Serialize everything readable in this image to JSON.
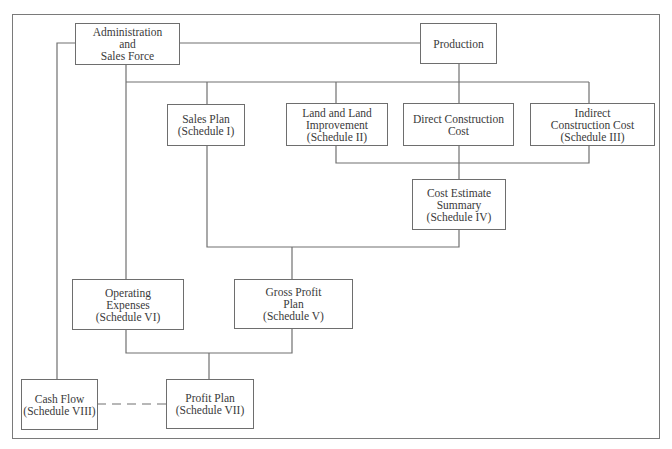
{
  "diagram": {
    "nodes": {
      "admin": {
        "lines": [
          "Administration",
          "and",
          "Sales Force"
        ]
      },
      "production": {
        "lines": [
          "Production"
        ]
      },
      "sales_plan": {
        "lines": [
          "Sales Plan",
          "(Schedule I)"
        ]
      },
      "land": {
        "lines": [
          "Land and Land",
          "Improvement",
          "(Schedule II)"
        ]
      },
      "direct": {
        "lines": [
          "Direct Construction",
          "Cost"
        ]
      },
      "indirect": {
        "lines": [
          "Indirect",
          "Construction Cost",
          "(Schedule III)"
        ]
      },
      "cost_estimate": {
        "lines": [
          "Cost Estimate",
          "Summary",
          "(Schedule IV)"
        ]
      },
      "operating": {
        "lines": [
          "Operating",
          "Expenses",
          "(Schedule VI)"
        ]
      },
      "gross_profit": {
        "lines": [
          "Gross Profit",
          "Plan",
          "(Schedule V)"
        ]
      },
      "cash_flow": {
        "lines": [
          "Cash Flow",
          "(Schedule VIII)"
        ]
      },
      "profit_plan": {
        "lines": [
          "Profit Plan",
          "(Schedule VII)"
        ]
      }
    },
    "edges": [
      {
        "from": "admin",
        "to": "production",
        "style": "solid"
      },
      {
        "from": "admin",
        "to": "sales_plan",
        "style": "solid"
      },
      {
        "from": "admin",
        "to": "operating",
        "style": "solid"
      },
      {
        "from": "admin",
        "to": "cash_flow",
        "style": "solid"
      },
      {
        "from": "production",
        "to": "land",
        "style": "solid"
      },
      {
        "from": "production",
        "to": "direct",
        "style": "solid"
      },
      {
        "from": "production",
        "to": "indirect",
        "style": "solid"
      },
      {
        "from": "land",
        "to": "cost_estimate",
        "style": "solid"
      },
      {
        "from": "direct",
        "to": "cost_estimate",
        "style": "solid"
      },
      {
        "from": "indirect",
        "to": "cost_estimate",
        "style": "solid"
      },
      {
        "from": "sales_plan",
        "to": "gross_profit",
        "style": "solid"
      },
      {
        "from": "cost_estimate",
        "to": "gross_profit",
        "style": "solid"
      },
      {
        "from": "operating",
        "to": "profit_plan",
        "style": "solid"
      },
      {
        "from": "gross_profit",
        "to": "profit_plan",
        "style": "solid"
      },
      {
        "from": "cash_flow",
        "to": "profit_plan",
        "style": "dashed"
      }
    ],
    "colors": {
      "line": "#707070",
      "text": "#3a3a3a",
      "background": "#ffffff"
    }
  }
}
